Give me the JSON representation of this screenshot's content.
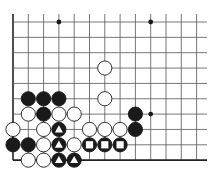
{
  "diagram": {
    "type": "go-board-fragment",
    "grid": {
      "x0": 13,
      "y0": 22,
      "dx": 15.3,
      "dy": 15.35,
      "cols": 13,
      "rows": 10,
      "top_extend": 14,
      "right_extend": 207,
      "left_edge": true,
      "bottom_edge": true
    },
    "colors": {
      "line": "#555555",
      "edge": "#222222",
      "black": "#1a1a1a",
      "white": "#ffffff",
      "mark_black_stone": "#ffffff"
    },
    "star_points": [
      {
        "col": 3,
        "row": 0
      },
      {
        "col": 9,
        "row": 0
      },
      {
        "col": 9,
        "row": 6
      }
    ],
    "stones": [
      {
        "col": 6,
        "row": 3,
        "color": "white"
      },
      {
        "col": 6,
        "row": 5,
        "color": "white"
      },
      {
        "col": 1,
        "row": 5,
        "color": "black"
      },
      {
        "col": 2,
        "row": 5,
        "color": "black"
      },
      {
        "col": 3,
        "row": 5,
        "color": "black"
      },
      {
        "col": 1,
        "row": 6,
        "color": "white"
      },
      {
        "col": 2,
        "row": 6,
        "color": "black"
      },
      {
        "col": 3,
        "row": 6,
        "color": "white"
      },
      {
        "col": 4,
        "row": 6,
        "color": "white"
      },
      {
        "col": 8,
        "row": 6,
        "color": "black"
      },
      {
        "col": 0,
        "row": 7,
        "color": "white"
      },
      {
        "col": 2,
        "row": 7,
        "color": "white"
      },
      {
        "col": 3,
        "row": 7,
        "color": "black",
        "mark": "triangle"
      },
      {
        "col": 5,
        "row": 7,
        "color": "white"
      },
      {
        "col": 6,
        "row": 7,
        "color": "white"
      },
      {
        "col": 7,
        "row": 7,
        "color": "white"
      },
      {
        "col": 8,
        "row": 7,
        "color": "black"
      },
      {
        "col": 0,
        "row": 8,
        "color": "black"
      },
      {
        "col": 1,
        "row": 8,
        "color": "black"
      },
      {
        "col": 2,
        "row": 8,
        "color": "white"
      },
      {
        "col": 3,
        "row": 8,
        "color": "black",
        "mark": "triangle"
      },
      {
        "col": 4,
        "row": 8,
        "color": "white"
      },
      {
        "col": 5,
        "row": 8,
        "color": "black",
        "mark": "square"
      },
      {
        "col": 6,
        "row": 8,
        "color": "black",
        "mark": "square"
      },
      {
        "col": 7,
        "row": 8,
        "color": "black",
        "mark": "square"
      },
      {
        "col": 1,
        "row": 9,
        "color": "white"
      },
      {
        "col": 2,
        "row": 9,
        "color": "white"
      },
      {
        "col": 3,
        "row": 9,
        "color": "black",
        "mark": "triangle"
      },
      {
        "col": 4,
        "row": 9,
        "color": "black",
        "mark": "triangle"
      }
    ]
  }
}
